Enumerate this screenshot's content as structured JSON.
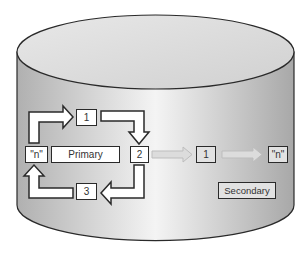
{
  "diagram": {
    "type": "database-replication",
    "container": "cylinder",
    "primary": {
      "label": "Primary",
      "cycle_steps": [
        "1",
        "2",
        "3",
        "\"n\""
      ]
    },
    "secondary": {
      "label": "Secondary",
      "steps": [
        "1",
        "\"n\""
      ]
    },
    "colors": {
      "cylinder_light": "#f2f2f2",
      "cylinder_dark": "#b5b5b5",
      "outline": "#2a2a2a",
      "arrow_fill": "#ffffff",
      "replication_arrow": "#dcdcdc",
      "secondary_box": "#e2e2e2"
    }
  }
}
